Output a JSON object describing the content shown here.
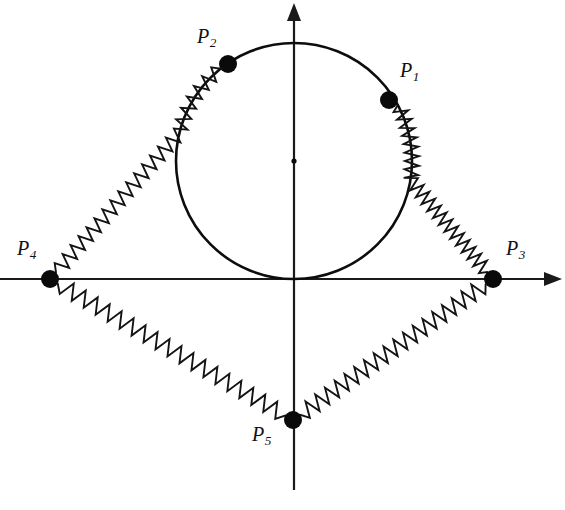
{
  "figure": {
    "background_color": "#ffffff",
    "stroke_color": "#111111",
    "width": 565,
    "height": 510
  },
  "axes": {
    "origin": {
      "x": 294,
      "y": 279
    },
    "x_axis": {
      "label": "",
      "x_start": 0,
      "x_end": 562,
      "y": 279,
      "arrow_end": "right"
    },
    "y_axis": {
      "label": "",
      "y_start": 3,
      "y_end": 490,
      "x": 294,
      "arrow_end": "top"
    }
  },
  "circle": {
    "center": {
      "x": 294,
      "y": 161
    },
    "radius": 118,
    "center_marker": true
  },
  "nodes": [
    {
      "id": "P1",
      "label": "P",
      "subscript": "1",
      "x": 389,
      "y": 100,
      "radius": 9,
      "label_x": 400,
      "label_y": 60
    },
    {
      "id": "P2",
      "label": "P",
      "subscript": "2",
      "x": 228,
      "y": 64,
      "radius": 9,
      "label_x": 197,
      "label_y": 26
    },
    {
      "id": "P3",
      "label": "P",
      "subscript": "3",
      "x": 493,
      "y": 279,
      "radius": 9,
      "label_x": 506,
      "label_y": 238
    },
    {
      "id": "P4",
      "label": "P",
      "subscript": "4",
      "x": 50,
      "y": 279,
      "radius": 9,
      "label_x": 17,
      "label_y": 238
    },
    {
      "id": "P5",
      "label": "P",
      "subscript": "5",
      "x": 293,
      "y": 420,
      "radius": 9,
      "label_x": 252,
      "label_y": 424
    }
  ],
  "springs": [
    {
      "id": "spring-p1-p3",
      "from": "P1",
      "to": "P3",
      "coils": 22,
      "amplitude": 7,
      "shape": "arc-then-line"
    },
    {
      "id": "spring-p2-p4",
      "from": "P2",
      "to": "P4",
      "coils": 22,
      "amplitude": 7,
      "shape": "arc-then-line"
    },
    {
      "id": "spring-p4-p5",
      "from": "P4",
      "to": "P5",
      "coils": 19,
      "amplitude": 8,
      "shape": "line"
    },
    {
      "id": "spring-p5-p3",
      "from": "P5",
      "to": "P3",
      "coils": 19,
      "amplitude": 8,
      "shape": "line"
    }
  ]
}
